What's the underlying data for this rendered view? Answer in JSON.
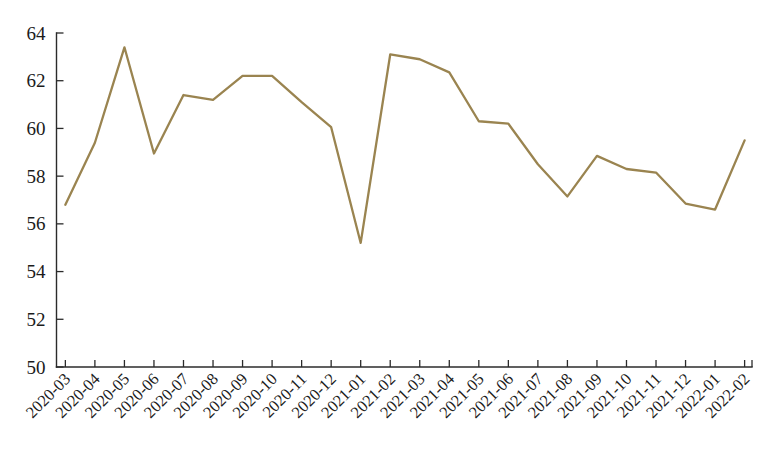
{
  "chart_data": {
    "type": "line",
    "title": "",
    "subtitle": "",
    "xlabel": "",
    "ylabel": "",
    "ylim": [
      50,
      64
    ],
    "yticks": [
      50,
      52,
      54,
      56,
      58,
      60,
      62,
      64
    ],
    "ytick_labels": [
      "50",
      "52",
      "54",
      "56",
      "58",
      "60",
      "62",
      "64"
    ],
    "grid": false,
    "legend": false,
    "legend_position": "none",
    "line_color": "#9a8450",
    "marker": "none",
    "xtick_rotation": 45,
    "categories": [
      "2020-03",
      "2020-04",
      "2020-05",
      "2020-06",
      "2020-07",
      "2020-08",
      "2020-09",
      "2020-10",
      "2020-11",
      "2020-12",
      "2021-01",
      "2021-02",
      "2021-03",
      "2021-04",
      "2021-05",
      "2021-06",
      "2021-07",
      "2021-08",
      "2021-09",
      "2021-10",
      "2021-11",
      "2021-12",
      "2022-01",
      "2022-02"
    ],
    "values": [
      56.8,
      59.4,
      63.4,
      58.95,
      61.4,
      61.2,
      62.2,
      62.2,
      61.1,
      60.05,
      55.2,
      63.1,
      62.9,
      62.35,
      60.3,
      60.2,
      58.5,
      57.15,
      58.85,
      58.3,
      58.15,
      56.85,
      56.6,
      59.5
    ]
  }
}
